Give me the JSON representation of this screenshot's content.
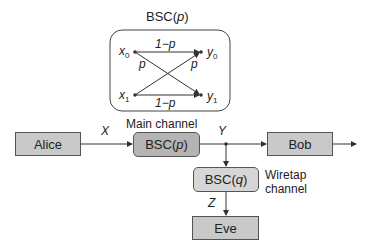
{
  "bsc_detail": {
    "title_prefix": "BSC(",
    "title_param": "p",
    "title_suffix": ")",
    "inputs": [
      {
        "base": "x",
        "sub": "0"
      },
      {
        "base": "x",
        "sub": "1"
      }
    ],
    "outputs": [
      {
        "base": "y",
        "sub": "0"
      },
      {
        "base": "y",
        "sub": "1"
      }
    ],
    "straight_label": "1−p",
    "cross_label": "p"
  },
  "nodes": {
    "alice": "Alice",
    "main_channel": {
      "label_prefix": "BSC(",
      "param": "p",
      "label_suffix": ")",
      "caption": "Main channel"
    },
    "bob": "Bob",
    "wiretap_channel": {
      "label_prefix": "BSC(",
      "param": "q",
      "label_suffix": ")",
      "caption_line1": "Wiretap",
      "caption_line2": "channel"
    },
    "eve": "Eve"
  },
  "signals": {
    "x": "X",
    "y": "Y",
    "z": "Z"
  },
  "colors": {
    "box_fill": "#c9c9c9",
    "channel_fill": "#b4b4b4",
    "wiretap_fill": "#d6d6d6",
    "line": "#333333"
  }
}
